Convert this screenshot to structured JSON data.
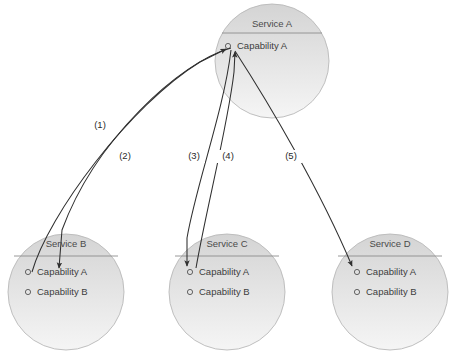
{
  "diagram": {
    "background_color": "#ffffff",
    "circle_fill_top": "#d5d5d5",
    "circle_fill_bottom": "#f3f3f3",
    "circle_stroke": "#b9b9b9",
    "edge_color": "#2f2f2f",
    "services": [
      {
        "id": "service-a",
        "title": "Service A",
        "cx": 272,
        "cy": 61,
        "r": 57,
        "title_y": 27,
        "divider_y": 33,
        "divider_x1": 222,
        "divider_x2": 322,
        "capabilities": [
          {
            "label": "Capability A",
            "marker_x": 228,
            "marker_y": 46,
            "text_x": 237,
            "text_y": 49
          }
        ]
      },
      {
        "id": "service-b",
        "title": "Service B",
        "cx": 66,
        "cy": 292,
        "r": 58,
        "title_y": 247,
        "divider_y": 256,
        "divider_x1": 14,
        "divider_x2": 118,
        "capabilities": [
          {
            "label": "Capability A",
            "marker_x": 28,
            "marker_y": 272,
            "text_x": 37,
            "text_y": 275
          },
          {
            "label": "Capability B",
            "marker_x": 28,
            "marker_y": 292,
            "text_x": 37,
            "text_y": 295
          }
        ]
      },
      {
        "id": "service-c",
        "title": "Service C",
        "cx": 227,
        "cy": 292,
        "r": 58,
        "title_y": 247,
        "divider_y": 256,
        "divider_x1": 175,
        "divider_x2": 279,
        "capabilities": [
          {
            "label": "Capability A",
            "marker_x": 190,
            "marker_y": 272,
            "text_x": 199,
            "text_y": 275
          },
          {
            "label": "Capability B",
            "marker_x": 190,
            "marker_y": 292,
            "text_x": 199,
            "text_y": 295
          }
        ]
      },
      {
        "id": "service-d",
        "title": "Service D",
        "cx": 390,
        "cy": 292,
        "r": 58,
        "title_y": 247,
        "divider_y": 256,
        "divider_x1": 338,
        "divider_x2": 442,
        "capabilities": [
          {
            "label": "Capability A",
            "marker_x": 357,
            "marker_y": 272,
            "text_x": 366,
            "text_y": 275
          },
          {
            "label": "Capability B",
            "marker_x": 357,
            "marker_y": 292,
            "text_x": 366,
            "text_y": 295
          }
        ]
      }
    ],
    "edges": [
      {
        "id": "edge-1",
        "label": "(1)",
        "from": "service-a.capability-a",
        "to": "service-b.capability-a",
        "path": "M 231 48 C 180 62 95 140 62 230 L 59 268",
        "label_x": 100,
        "label_y": 128,
        "arrow_at": "end"
      },
      {
        "id": "edge-2",
        "label": "(2)",
        "from": "service-b.capability-a",
        "to": "service-a.capability-a",
        "path": "M 32 272 C 48 215 130 105 200 62 L 226 49",
        "label_x": 125,
        "label_y": 159,
        "arrow_at": "end"
      },
      {
        "id": "edge-3",
        "label": "(3)",
        "from": "service-a.capability-a",
        "to": "service-c.capability-a",
        "path": "M 231 50 C 224 110 196 185 187 238 L 187 266",
        "label_x": 194,
        "label_y": 159,
        "arrow_at": "end"
      },
      {
        "id": "edge-4",
        "label": "(4)",
        "from": "service-c.capability-a",
        "to": "service-a.capability-a",
        "path": "M 196 268 C 206 210 228 125 234 72 L 235 52",
        "label_x": 228,
        "label_y": 159,
        "arrow_at": "end"
      },
      {
        "id": "edge-5",
        "label": "(5)",
        "from": "service-a.capability-a",
        "to": "service-d.capability-a",
        "path": "M 235 51 C 270 105 320 190 352 266",
        "label_x": 291,
        "label_y": 159,
        "arrow_at": "end"
      }
    ]
  }
}
